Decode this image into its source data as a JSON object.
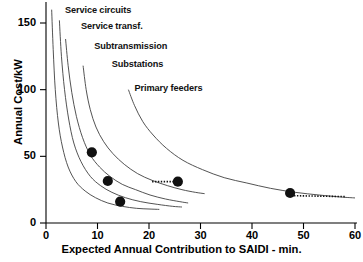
{
  "chart_data": {
    "type": "line",
    "title": "",
    "xlabel": "Expected Annual Contribution to SAIDI - min.",
    "ylabel": "Annual Cost/kW",
    "xlim": [
      0,
      60
    ],
    "ylim": [
      0,
      160
    ],
    "xticks": [
      0,
      10,
      20,
      30,
      40,
      50,
      60
    ],
    "xticklabels": [
      "0",
      "10",
      "20",
      "30",
      "40",
      "50",
      "60"
    ],
    "yticks": [
      0,
      50,
      100,
      150
    ],
    "yticklabels": [
      "0",
      "50",
      "100",
      "150"
    ],
    "grid": false,
    "legend_position": "inline-annotations",
    "series": [
      {
        "name": "Service circuits",
        "label": "Service circuits",
        "label_xy": [
          2.9,
          158
        ],
        "points": [
          [
            1.1,
            160
          ],
          [
            1.4,
            130
          ],
          [
            1.8,
            100
          ],
          [
            2.4,
            75
          ],
          [
            3.2,
            57
          ],
          [
            4.3,
            42
          ],
          [
            5.8,
            31
          ],
          [
            7.6,
            24
          ],
          [
            9.6,
            19
          ],
          [
            12.0,
            15
          ],
          [
            14.8,
            12.5
          ],
          [
            17.6,
            11
          ],
          [
            20.0,
            10.5
          ],
          [
            22.0,
            10.2
          ]
        ]
      },
      {
        "name": "Service transf.",
        "label": "Service transf.",
        "label_xy": [
          6.0,
          146
        ],
        "points": [
          [
            2.6,
            152
          ],
          [
            3.0,
            125
          ],
          [
            3.6,
            100
          ],
          [
            4.4,
            78
          ],
          [
            5.4,
            60
          ],
          [
            6.8,
            46
          ],
          [
            8.6,
            35
          ],
          [
            10.6,
            28
          ],
          [
            12.8,
            23
          ],
          [
            15.4,
            19
          ],
          [
            18.4,
            16
          ],
          [
            21.6,
            14
          ],
          [
            24.6,
            12.5
          ],
          [
            26.4,
            12
          ]
        ]
      },
      {
        "name": "Subtransmission",
        "label": "Subtransmission",
        "label_xy": [
          8.6,
          131
        ],
        "points": [
          [
            3.8,
            138
          ],
          [
            4.3,
            118
          ],
          [
            5.0,
            98
          ],
          [
            5.9,
            80
          ],
          [
            7.1,
            64
          ],
          [
            8.6,
            51
          ],
          [
            10.4,
            42
          ],
          [
            12.4,
            35
          ],
          [
            14.8,
            29
          ],
          [
            17.4,
            25
          ],
          [
            20.2,
            21
          ],
          [
            23.2,
            18
          ],
          [
            26.0,
            16
          ],
          [
            27.6,
            15
          ]
        ]
      },
      {
        "name": "Substations",
        "label": "Substations",
        "label_xy": [
          12.0,
          118
        ],
        "points": [
          [
            7.2,
            118
          ],
          [
            7.8,
            100
          ],
          [
            8.6,
            85
          ],
          [
            9.7,
            72
          ],
          [
            11.2,
            61
          ],
          [
            13.0,
            52
          ],
          [
            15.2,
            44
          ],
          [
            17.8,
            37
          ],
          [
            20.6,
            32
          ],
          [
            23.6,
            28
          ],
          [
            26.4,
            25
          ],
          [
            29.0,
            23
          ],
          [
            30.8,
            22
          ]
        ]
      },
      {
        "name": "Primary feeders",
        "label": "Primary feeders",
        "label_xy": [
          16.4,
          100
        ],
        "points": [
          [
            16.0,
            100
          ],
          [
            17.2,
            88
          ],
          [
            18.8,
            76
          ],
          [
            20.8,
            66
          ],
          [
            23.4,
            56
          ],
          [
            26.6,
            47
          ],
          [
            30.4,
            40
          ],
          [
            34.6,
            34
          ],
          [
            39.0,
            30
          ],
          [
            43.6,
            26
          ],
          [
            48.4,
            23
          ],
          [
            53.0,
            21
          ],
          [
            57.2,
            19.5
          ],
          [
            60.0,
            18.8
          ]
        ]
      }
    ],
    "markers": [
      {
        "label": "Service circuits optimum",
        "x": 8.9,
        "y": 53
      },
      {
        "label": "Service transf. optimum",
        "x": 12.0,
        "y": 31.5
      },
      {
        "label": "Subtransmission optimum",
        "x": 14.4,
        "y": 16
      },
      {
        "label": "Substations optimum",
        "x": 25.6,
        "y": 31
      },
      {
        "label": "Primary feeders optimum",
        "x": 47.4,
        "y": 22.5
      }
    ],
    "dotted_segments": [
      {
        "label": "substations-tangent",
        "x0": 20.6,
        "y0": 31.0,
        "x1": 25.4,
        "y1": 31.0
      },
      {
        "label": "primary-feeders-tangent",
        "x0": 47.6,
        "y0": 20.5,
        "x1": 58.2,
        "y1": 19.8
      }
    ]
  }
}
